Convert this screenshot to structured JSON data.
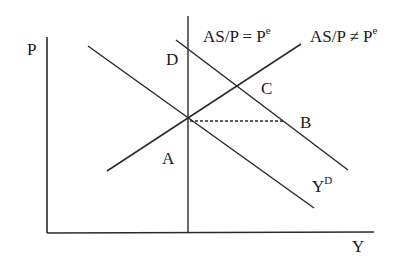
{
  "axes": {
    "y_label": "P",
    "x_label": "Y"
  },
  "curves": {
    "vertical_curve_label": "AS/P = P",
    "vertical_curve_sup": "e",
    "upward_curve_label": "AS/P ≠ P",
    "upward_curve_sup": "e",
    "demand_curve_label": "Y",
    "demand_curve_sup": "D"
  },
  "points": {
    "a": "A",
    "b": "B",
    "c": "C",
    "d": "D"
  },
  "colors": {
    "line": "#2a2a2a",
    "background": "#ffffff"
  }
}
